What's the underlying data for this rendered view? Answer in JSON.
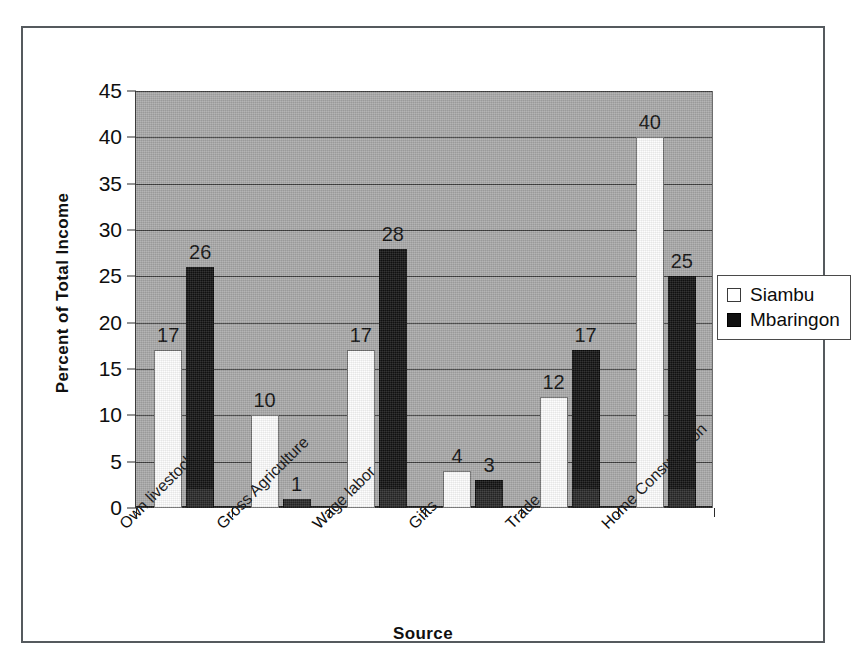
{
  "chart_data": {
    "type": "bar",
    "title": "",
    "xlabel": "Source",
    "ylabel": "Percent of Total Income",
    "ylim": [
      0,
      45
    ],
    "ytick_step": 5,
    "yticks": [
      0,
      5,
      10,
      15,
      20,
      25,
      30,
      35,
      40,
      45
    ],
    "grid": true,
    "legend_position": "right",
    "categories": [
      "Own livestock",
      "Gross Agriculture",
      "Wage labor",
      "Gifts",
      "Trade",
      "Home Consumption"
    ],
    "series": [
      {
        "name": "Siambu",
        "color": "#ffffff",
        "values": [
          17,
          10,
          17,
          4,
          12,
          40
        ]
      },
      {
        "name": "Mbaringon",
        "color": "#111111",
        "values": [
          26,
          1,
          28,
          3,
          17,
          25
        ]
      }
    ]
  },
  "axes": {
    "y_title": "Percent of Total Income",
    "x_title": "Source",
    "y_tick_labels": [
      "45",
      "40",
      "35",
      "30",
      "25",
      "20",
      "15",
      "10",
      "5",
      "0"
    ]
  },
  "legend": {
    "items": [
      {
        "label": "Siambu",
        "swatch": "white-square-icon"
      },
      {
        "label": "Mbaringon",
        "swatch": "black-square-icon"
      }
    ]
  },
  "colors": {
    "plot_background": "#a9a9a9",
    "gridline": "#3d3d3d",
    "series_siambu": "#ffffff",
    "series_mbaringon": "#111111",
    "text": "#0e0e0e",
    "frame": "#555a5e"
  }
}
